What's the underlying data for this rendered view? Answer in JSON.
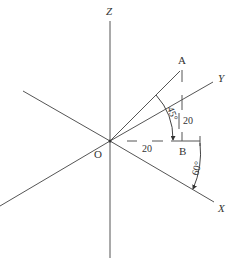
{
  "diagram": {
    "type": "axonometric-axes",
    "axes": {
      "z": {
        "label": "Z"
      },
      "y": {
        "label": "Y"
      },
      "x": {
        "label": "X"
      }
    },
    "points": {
      "origin": {
        "label": "O"
      },
      "a": {
        "label": "A"
      },
      "b": {
        "label": "B"
      }
    },
    "dimensions": {
      "horizontal": {
        "value": "20"
      },
      "vertical": {
        "value": "20"
      }
    },
    "angles": {
      "upper": {
        "value": "45°"
      },
      "lower": {
        "value": "60°"
      }
    },
    "colors": {
      "line": "#555555",
      "text": "#333333",
      "background": "#ffffff"
    }
  }
}
